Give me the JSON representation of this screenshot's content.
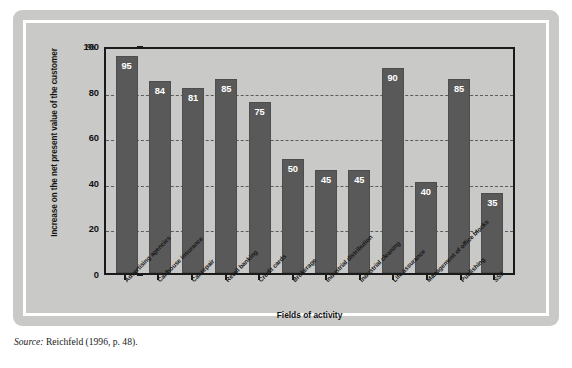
{
  "chart_data": {
    "type": "bar",
    "title": "",
    "xlabel": "Fields of activity",
    "ylabel": "Increase on the net present value of the customer",
    "unit": "%",
    "ylim": [
      0,
      100
    ],
    "yticks": [
      0,
      20,
      40,
      60,
      80,
      100
    ],
    "grid": "horizontal dashed gridlines at 20, 40, 60, 80",
    "legend": "none",
    "categories": [
      "Advertising agencies",
      "Car/house insurance",
      "Car repair",
      "Retail banking",
      "Credit cards",
      "Brokerage",
      "Industrial distribution",
      "Industrial cleaning",
      "Life assurance",
      "Management of office blocks",
      "Publishing",
      "SSII"
    ],
    "values": [
      95,
      84,
      81,
      85,
      75,
      50,
      45,
      45,
      90,
      40,
      85,
      35
    ],
    "bar_color": "#595959",
    "plot_background": "#c9c9c7",
    "axis_color": "#1a1a1a",
    "value_label_color": "#ffffff"
  },
  "source": {
    "prefix": "Source:",
    "text": "Reichfeld (1996, p. 48)."
  }
}
